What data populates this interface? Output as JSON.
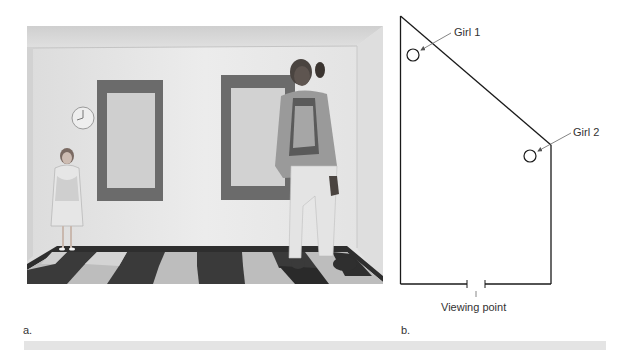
{
  "figure": {
    "panel_a": {
      "label": "a.",
      "photo": {
        "description": "Ames room photograph: small child standing at left corner, tall adult standing at right corner, two dark-framed windows, wall clock, checkered floor",
        "colors": {
          "wall": "#e8e8e8",
          "ceiling": "#d6d6d6",
          "window_frame": "#6b6b6b",
          "window_glass": "#cfcfcf",
          "floor_dark": "#3a3a3a",
          "floor_light": "#c8c8c8",
          "baseboard": "#2e2e2e"
        }
      }
    },
    "panel_b": {
      "label": "b.",
      "diagram": {
        "line_color": "#1a1a1a",
        "girl1_label": "Girl 1",
        "girl2_label": "Girl 2",
        "viewing_point_label": "Viewing point"
      }
    },
    "footer_band_color": "#e4e4e4"
  }
}
